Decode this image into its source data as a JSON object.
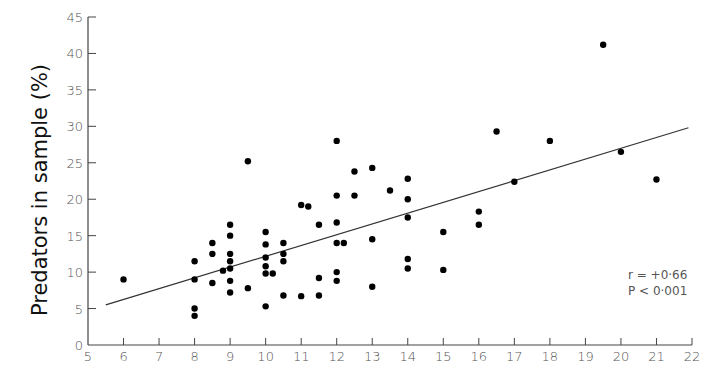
{
  "chart_data": {
    "type": "scatter",
    "title": "",
    "xlabel": "",
    "ylabel": "Predators in sample (%)",
    "xlim": [
      5,
      22
    ],
    "ylim": [
      0,
      45
    ],
    "x_ticks": [
      5,
      6,
      7,
      8,
      9,
      10,
      11,
      12,
      13,
      14,
      15,
      16,
      17,
      18,
      19,
      20,
      21,
      22
    ],
    "y_ticks": [
      0,
      5,
      10,
      15,
      20,
      25,
      30,
      35,
      40,
      45
    ],
    "grid": false,
    "legend": null,
    "points": [
      [
        6,
        9
      ],
      [
        8,
        11.5
      ],
      [
        8,
        9
      ],
      [
        8,
        5
      ],
      [
        8,
        4
      ],
      [
        8.5,
        14
      ],
      [
        8.5,
        12.5
      ],
      [
        8.5,
        8.5
      ],
      [
        8.8,
        10.2
      ],
      [
        9,
        16.5
      ],
      [
        9,
        15
      ],
      [
        9,
        12.5
      ],
      [
        9,
        11.5
      ],
      [
        9,
        10.5
      ],
      [
        9,
        8.8
      ],
      [
        9,
        7.2
      ],
      [
        9.5,
        25.2
      ],
      [
        9.5,
        7.8
      ],
      [
        10,
        15.5
      ],
      [
        10,
        13.8
      ],
      [
        10,
        12
      ],
      [
        10,
        10.8
      ],
      [
        10,
        9.8
      ],
      [
        10,
        5.3
      ],
      [
        10.2,
        9.8
      ],
      [
        10.5,
        14
      ],
      [
        10.5,
        12.5
      ],
      [
        10.5,
        11.5
      ],
      [
        10.5,
        6.8
      ],
      [
        11,
        19.2
      ],
      [
        11.2,
        19
      ],
      [
        11,
        6.7
      ],
      [
        11.5,
        16.5
      ],
      [
        11.5,
        9.2
      ],
      [
        11.5,
        6.8
      ],
      [
        12,
        28
      ],
      [
        12,
        20.5
      ],
      [
        12,
        16.8
      ],
      [
        12,
        14
      ],
      [
        12,
        10
      ],
      [
        12,
        8.8
      ],
      [
        12.2,
        14
      ],
      [
        12.5,
        23.8
      ],
      [
        12.5,
        20.5
      ],
      [
        13,
        24.3
      ],
      [
        13,
        14.5
      ],
      [
        13,
        8
      ],
      [
        13.5,
        21.2
      ],
      [
        14,
        22.8
      ],
      [
        14,
        20
      ],
      [
        14,
        17.5
      ],
      [
        14,
        11.8
      ],
      [
        14,
        10.5
      ],
      [
        15,
        15.5
      ],
      [
        15,
        10.3
      ],
      [
        16,
        18.3
      ],
      [
        16,
        16.5
      ],
      [
        16.5,
        29.3
      ],
      [
        17,
        22.4
      ],
      [
        18,
        28
      ],
      [
        19.5,
        41.2
      ],
      [
        20,
        26.5
      ],
      [
        21,
        22.7
      ]
    ],
    "regression_line": {
      "x": [
        5.5,
        21.9
      ],
      "y": [
        5.5,
        29.8
      ]
    },
    "annotations": [
      "r = +0.66",
      "P < 0.001"
    ]
  },
  "labels": {
    "ylabel": "Predators in sample (%)",
    "stat_r": "r = +0·66",
    "stat_p": "P < 0·001"
  }
}
